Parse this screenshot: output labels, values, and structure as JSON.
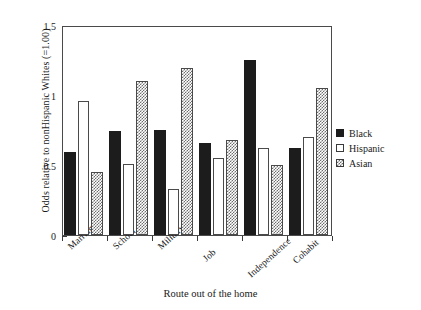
{
  "chart_data": {
    "type": "bar",
    "title": "",
    "xlabel": "Route out of the home",
    "ylabel": "Odds relative to nonHispanic Whites (=1.00)",
    "categories": [
      "Marriage",
      "School",
      "Military",
      "Job",
      "Independence",
      "Cohabit"
    ],
    "series": [
      {
        "name": "Black",
        "values": [
          0.59,
          0.74,
          0.75,
          0.66,
          1.25,
          0.62
        ]
      },
      {
        "name": "Hispanic",
        "values": [
          0.96,
          0.51,
          0.33,
          0.55,
          0.62,
          0.7
        ]
      },
      {
        "name": "Asian",
        "values": [
          0.45,
          1.1,
          1.19,
          0.68,
          0.5,
          1.05
        ]
      }
    ],
    "ylim": [
      0,
      1.5
    ],
    "yticks": [
      0,
      0.5,
      1,
      1.5
    ],
    "ytick_labels": [
      "0",
      "0.5",
      "1",
      "1.5"
    ],
    "grid": false,
    "legend_position": "right",
    "colors": {
      "black": "#1c1c1c",
      "hispanic": "#ffffff",
      "asian": "#6e6e6e",
      "axis": "#4a4a4a",
      "text": "#1a1a1a",
      "background": "#ffffff"
    }
  },
  "legend": {
    "items": [
      {
        "label": "Black",
        "style": "black"
      },
      {
        "label": "Hispanic",
        "style": "hispanic"
      },
      {
        "label": "Asian",
        "style": "asian"
      }
    ]
  }
}
